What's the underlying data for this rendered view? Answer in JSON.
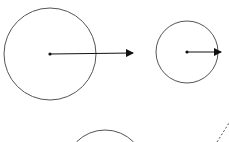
{
  "diagram": {
    "stroke_color": "#555555",
    "arrow_color": "#111111",
    "background": "#ffffff",
    "shapes": [
      {
        "id": "large-circle",
        "cx": 50,
        "cy": 54,
        "r": 46
      },
      {
        "id": "small-circle",
        "cx": 187,
        "cy": 52,
        "r": 31
      },
      {
        "id": "bottom-circle-partial",
        "cx": 105,
        "cy": 170,
        "r": 40
      }
    ],
    "vectors": [
      {
        "id": "large-arrow",
        "x1": 50,
        "y1": 54,
        "x2": 139,
        "y2": 53
      },
      {
        "id": "small-arrow",
        "x1": 187,
        "y1": 52,
        "x2": 227,
        "y2": 52
      }
    ],
    "dashed_line": {
      "x1": 217,
      "y1": 142,
      "x2": 229,
      "y2": 123
    }
  }
}
